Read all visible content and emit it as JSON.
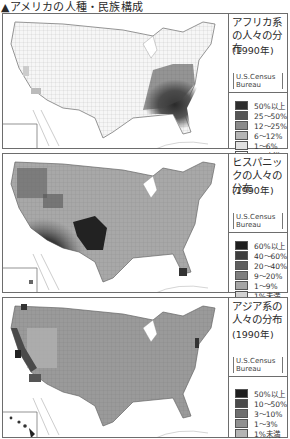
{
  "page": {
    "title": "▲アメリカの人種・民族構成"
  },
  "panels": [
    {
      "title": "アフリカ系の人々の分布",
      "year": "(1990年)",
      "source_line1": "U.S.Census",
      "source_line2": "Bureau",
      "legend": [
        {
          "label": "50%以上",
          "color": "#2e2e2e"
        },
        {
          "label": "25〜50%",
          "color": "#555555"
        },
        {
          "label": "12〜25%",
          "color": "#8a8a8a"
        },
        {
          "label": "6〜12%",
          "color": "#b5b5b5"
        },
        {
          "label": "1〜6%",
          "color": "#e0e0e0"
        },
        {
          "label": "1%未満",
          "color": "#ffffff"
        }
      ],
      "concentration": "southeast"
    },
    {
      "title": "ヒスパニックの人々の分布",
      "year": "(1990年)",
      "source_line1": "U.S.Census",
      "source_line2": "Bureau",
      "legend": [
        {
          "label": "60%以上",
          "color": "#1e1e1e"
        },
        {
          "label": "40〜60%",
          "color": "#3d3d3d"
        },
        {
          "label": "20〜40%",
          "color": "#5e5e5e"
        },
        {
          "label": "9〜20%",
          "color": "#7e7e7e"
        },
        {
          "label": "1〜9%",
          "color": "#a6a6a6"
        },
        {
          "label": "1%未満",
          "color": "#d2d2d2"
        }
      ],
      "concentration": "southwest"
    },
    {
      "title": "アジア系の人々の分布",
      "year": "(1990年)",
      "source_line1": "U.S.Census",
      "source_line2": "Bureau",
      "legend": [
        {
          "label": "50%以上",
          "color": "#1e1e1e"
        },
        {
          "label": "10〜50%",
          "color": "#4a4a4a"
        },
        {
          "label": "3〜10%",
          "color": "#6e6e6e"
        },
        {
          "label": "1〜3%",
          "color": "#909090"
        },
        {
          "label": "1%未満",
          "color": "#b4b4b4"
        }
      ],
      "concentration": "west-coast-hawaii"
    }
  ]
}
